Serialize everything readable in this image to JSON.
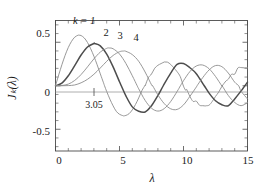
{
  "chart_data": {
    "type": "line",
    "title": "",
    "subtitle": "",
    "xlabel": "λ",
    "ylabel": "Jₖ(λ)",
    "xlim": [
      0,
      15
    ],
    "ylim": [
      -0.75,
      0.75
    ],
    "grid": false,
    "legend_position": "inline-curve-labels",
    "x_ticks": [
      0,
      5,
      10,
      15
    ],
    "x_tick_labels": [
      "0",
      "5",
      "10",
      "15"
    ],
    "x_minor_tick_step": 1,
    "y_ticks": [
      -0.5,
      0,
      0.5
    ],
    "y_tick_labels": [
      "-0.5",
      "0",
      "0.5"
    ],
    "y_minor_tick_step": 0.1,
    "annotations": [
      {
        "name": "first-maximum-marker",
        "text": "3.05",
        "x": 3.05,
        "y": 0
      }
    ],
    "series": [
      {
        "name": "k = 1",
        "label": "1",
        "color": "#8c8c8c",
        "width": 0.9,
        "first_max_x": 1.84,
        "first_max_y": 0.581,
        "x": [
          0,
          0.25,
          0.5,
          0.75,
          1,
          1.25,
          1.5,
          1.75,
          1.84,
          2,
          2.25,
          2.5,
          2.75,
          3,
          3.25,
          3.5,
          3.75,
          3.83,
          4,
          4.25,
          4.5,
          4.75,
          5,
          5.25,
          5.33,
          5.5,
          5.75,
          6,
          6.25,
          6.5,
          6.75,
          7,
          7.02,
          7.25,
          7.5,
          7.75,
          8,
          8.25,
          8.5,
          8.54,
          8.75,
          9,
          9.25,
          9.5,
          9.75,
          10,
          10.17,
          10.25,
          10.5,
          10.75,
          11,
          11.25,
          11.5,
          11.71,
          11.75,
          12,
          12.25,
          12.5,
          12.75,
          13,
          13.32,
          13.5,
          13.75,
          14,
          14.25,
          14.5,
          14.75,
          15
        ],
        "y": [
          0,
          0.124,
          0.242,
          0.349,
          0.44,
          0.51,
          0.558,
          0.58,
          0.581,
          0.577,
          0.549,
          0.497,
          0.425,
          0.339,
          0.242,
          0.137,
          0.034,
          0,
          -0.066,
          -0.154,
          -0.231,
          -0.294,
          -0.328,
          -0.343,
          -0.346,
          -0.341,
          -0.321,
          -0.277,
          -0.215,
          -0.14,
          -0.056,
          0.005,
          0.005,
          0.092,
          0.135,
          0.201,
          0.235,
          0.255,
          0.273,
          0.272,
          0.271,
          0.245,
          0.205,
          0.161,
          0.104,
          -0.005,
          -0.052,
          -0.043,
          -0.123,
          -0.18,
          -0.177,
          -0.224,
          -0.229,
          -0.232,
          -0.23,
          -0.223,
          -0.18,
          -0.123,
          -0.073,
          -0.007,
          0.055,
          0.075,
          0.132,
          0.133,
          0.205,
          0.209,
          0.206,
          0.206
        ]
      },
      {
        "name": "k = 2",
        "label": "2",
        "color": "#4d4d4d",
        "width": 1.5,
        "first_max_x": 3.05,
        "first_max_y": 0.486,
        "x": [
          0,
          0.5,
          1,
          1.5,
          2,
          2.5,
          3,
          3.05,
          3.5,
          4,
          4.5,
          5,
          5.14,
          5.5,
          6,
          6.5,
          7,
          7.5,
          8,
          8.42,
          9,
          9.5,
          10,
          10.5,
          11,
          11.62,
          12,
          12.5,
          13,
          13.5,
          14,
          14.5,
          15
        ],
        "y": [
          0,
          0.031,
          0.115,
          0.232,
          0.353,
          0.446,
          0.486,
          0.486,
          0.459,
          0.364,
          0.217,
          0.046,
          0,
          -0.117,
          -0.243,
          -0.293,
          -0.301,
          -0.23,
          -0.113,
          0,
          0.145,
          0.245,
          0.255,
          0.207,
          0.139,
          0,
          -0.085,
          -0.173,
          -0.218,
          -0.23,
          -0.151,
          -0.059,
          0.042
        ]
      },
      {
        "name": "k = 3",
        "label": "3",
        "color": "#8c8c8c",
        "width": 0.9,
        "first_max_x": 4.2,
        "first_max_y": 0.434,
        "x": [
          0,
          0.5,
          1,
          1.5,
          2,
          2.5,
          3,
          3.5,
          4,
          4.2,
          4.5,
          5,
          5.5,
          6,
          6.38,
          6.5,
          7,
          7.5,
          8,
          8.5,
          9,
          9.5,
          9.76,
          10,
          10.5,
          11,
          11.5,
          12,
          12.5,
          13,
          13.02,
          13.5,
          14,
          14.5,
          15
        ],
        "y": [
          0,
          0.003,
          0.019,
          0.061,
          0.129,
          0.217,
          0.309,
          0.387,
          0.43,
          0.434,
          0.425,
          0.365,
          0.256,
          0.115,
          0,
          -0.035,
          -0.168,
          -0.258,
          -0.291,
          -0.262,
          -0.181,
          -0.066,
          0,
          0.058,
          0.163,
          0.227,
          0.238,
          0.195,
          0.107,
          -0.003,
          0,
          -0.112,
          -0.192,
          -0.229,
          -0.194
        ]
      },
      {
        "name": "k = 4",
        "label": "4",
        "color": "#8c8c8c",
        "width": 0.9,
        "first_max_x": 5.32,
        "first_max_y": 0.399,
        "x": [
          0,
          0.5,
          1,
          1.5,
          2,
          2.5,
          3,
          3.5,
          4,
          4.5,
          5,
          5.32,
          5.5,
          6,
          6.5,
          7,
          7.5,
          7.59,
          8,
          8.5,
          9,
          9.5,
          10,
          10.5,
          11,
          11.06,
          11.5,
          12,
          12.5,
          13,
          13.5,
          14,
          14.31,
          14.5,
          15
        ],
        "y": [
          0,
          0.0003,
          0.002,
          0.009,
          0.034,
          0.074,
          0.132,
          0.204,
          0.281,
          0.348,
          0.391,
          0.399,
          0.396,
          0.358,
          0.281,
          0.158,
          0.011,
          0,
          -0.105,
          -0.206,
          -0.265,
          -0.272,
          -0.22,
          -0.122,
          -0.015,
          0,
          0.093,
          0.182,
          0.232,
          0.219,
          0.146,
          0.041,
          0,
          -0.063,
          -0.151
        ]
      }
    ],
    "curve_labels": [
      {
        "text": "k = 1",
        "series": "k = 1"
      },
      {
        "text": "2",
        "series": "k = 2"
      },
      {
        "text": "3",
        "series": "k = 3"
      },
      {
        "text": "4",
        "series": "k = 4"
      }
    ]
  }
}
